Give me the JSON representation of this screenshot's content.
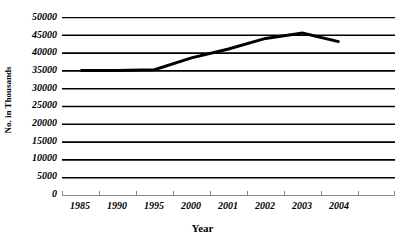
{
  "chart_data": {
    "type": "line",
    "title": "",
    "xlabel": "Year",
    "ylabel": "No. in Thousands",
    "categories": [
      "1985",
      "1990",
      "1995",
      "2000",
      "2001",
      "2002",
      "2003",
      "2004"
    ],
    "series": [
      {
        "name": "No. in Thousands",
        "values": [
          35000,
          35000,
          35200,
          38500,
          41000,
          44000,
          45500,
          43000
        ]
      }
    ],
    "ylim": [
      0,
      50000
    ],
    "yticks": [
      0,
      5000,
      10000,
      15000,
      20000,
      25000,
      30000,
      35000,
      40000,
      45000,
      50000
    ],
    "ytick_labels": [
      "0",
      "5000",
      "10000",
      "15000",
      "20000",
      "25000",
      "30000",
      "35000",
      "40000",
      "45000",
      "50000"
    ],
    "grid": "horizontal",
    "legend": "none",
    "line_color": "#000000",
    "line_width": 3,
    "gridline_color": "#000000",
    "axis_color": "#808080",
    "background_color": "#ffffff",
    "markers": "none"
  }
}
